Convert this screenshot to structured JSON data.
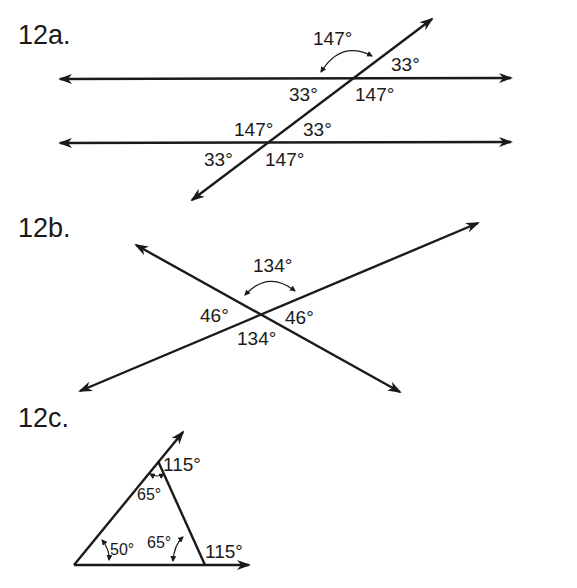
{
  "problems": [
    {
      "label": "12a.",
      "type": "parallel lines cut by transversal",
      "angles": {
        "top_intersection": {
          "upper_left": "147°",
          "upper_right": "33°",
          "lower_left": "33°",
          "lower_right": "147°"
        },
        "bottom_intersection": {
          "upper_left": "147°",
          "upper_right": "33°",
          "lower_left": "33°",
          "lower_right": "147°"
        }
      }
    },
    {
      "label": "12b.",
      "type": "intersecting lines / vertical angles",
      "angles": {
        "top": "134°",
        "left": "46°",
        "right": "46°",
        "bottom": "134°"
      }
    },
    {
      "label": "12c.",
      "type": "triangle with exterior angles",
      "angles": {
        "apex_exterior": "115°",
        "apex_interior": "65°",
        "base_left_interior": "50°",
        "base_right_interior": "65°",
        "base_right_exterior": "115°"
      }
    }
  ]
}
